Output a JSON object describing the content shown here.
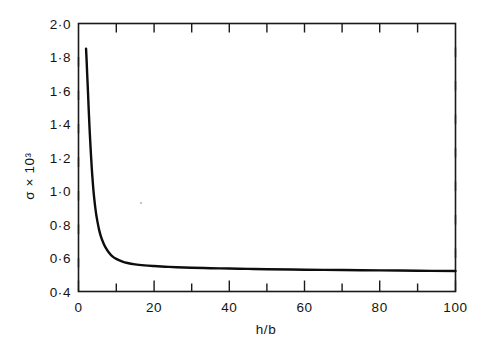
{
  "chart_data": {
    "type": "line",
    "title": "",
    "subtitle": "",
    "xlabel": "h/b",
    "ylabel": "σ × 10³",
    "xlim": [
      0,
      100
    ],
    "ylim": [
      0.4,
      2.0
    ],
    "grid": false,
    "legend": null,
    "x_major_ticks": [
      0,
      20,
      40,
      60,
      80,
      100
    ],
    "x_minor_ticks": [
      10,
      30,
      50,
      70,
      90
    ],
    "x_tick_labels": [
      "0",
      "20",
      "40",
      "60",
      "80",
      "100"
    ],
    "y_major_ticks": [
      0.4,
      0.6,
      0.8,
      1.0,
      1.2,
      1.4,
      1.6,
      1.8,
      2.0
    ],
    "y_tick_labels": [
      "0·4",
      "0·6",
      "0·8",
      "1·0",
      "1·2",
      "1·4",
      "1·6",
      "1·8",
      "2·0"
    ],
    "series": [
      {
        "name": "sigma vs h/b",
        "color": "#0d0d0d",
        "x": [
          2.0,
          2.15,
          2.3,
          2.5,
          2.7,
          2.9,
          3.1,
          3.35,
          3.6,
          3.9,
          4.2,
          4.6,
          5.0,
          5.5,
          6.0,
          6.6,
          7.2,
          8.0,
          9.0,
          10.0,
          11.5,
          13.0,
          15.0,
          17.5,
          20.0,
          23.0,
          26.0,
          30.0,
          35.0,
          40.0,
          45.0,
          50.0,
          60.0,
          70.0,
          80.0,
          90.0,
          100.0
        ],
        "y": [
          1.85,
          1.78,
          1.7,
          1.6,
          1.49,
          1.39,
          1.3,
          1.2,
          1.11,
          1.02,
          0.95,
          0.875,
          0.82,
          0.765,
          0.725,
          0.69,
          0.662,
          0.635,
          0.61,
          0.595,
          0.58,
          0.57,
          0.562,
          0.556,
          0.552,
          0.548,
          0.545,
          0.542,
          0.539,
          0.537,
          0.535,
          0.533,
          0.53,
          0.528,
          0.526,
          0.524,
          0.522
        ]
      }
    ]
  },
  "axes": {
    "frame_present": true,
    "tick_direction": "inward",
    "sides_with_ticks": [
      "top",
      "bottom",
      "left",
      "right"
    ]
  }
}
